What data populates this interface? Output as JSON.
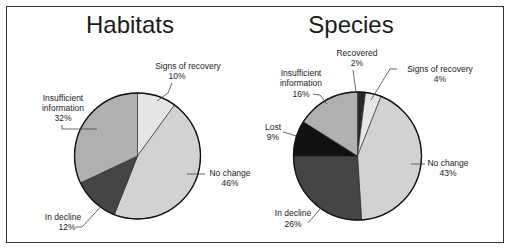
{
  "chart_data": [
    {
      "type": "pie",
      "title": "Habitats",
      "start_angle_deg": 0,
      "direction": "clockwise",
      "slices": [
        {
          "label": "Signs of recovery",
          "value": 10,
          "value_label": "10%",
          "color": "#e6e6e6"
        },
        {
          "label": "No change",
          "value": 46,
          "value_label": "46%",
          "color": "#d2d2d2"
        },
        {
          "label": "In decline",
          "value": 12,
          "value_label": "12%",
          "color": "#454545"
        },
        {
          "label": "Insufficient information",
          "value": 32,
          "value_label": "32%",
          "color": "#b0b0b0"
        }
      ]
    },
    {
      "type": "pie",
      "title": "Species",
      "start_angle_deg": 0,
      "direction": "clockwise",
      "slices": [
        {
          "label": "Recovered",
          "value": 2,
          "value_label": "2%",
          "color": "#2a2a2a"
        },
        {
          "label": "Signs of recovery",
          "value": 4,
          "value_label": "4%",
          "color": "#e6e6e6"
        },
        {
          "label": "No change",
          "value": 43,
          "value_label": "43%",
          "color": "#d2d2d2"
        },
        {
          "label": "In decline",
          "value": 26,
          "value_label": "26%",
          "color": "#454545"
        },
        {
          "label": "Lost",
          "value": 9,
          "value_label": "9%",
          "color": "#111111"
        },
        {
          "label": "Insufficient information",
          "value": 16,
          "value_label": "16%",
          "color": "#b0b0b0"
        }
      ]
    }
  ],
  "habitats": {
    "title": "Habitats",
    "labels": {
      "signs_line1": "Signs of recovery",
      "signs_pct": "10%",
      "insufficient_line1": "Insufficient",
      "insufficient_line2": "information",
      "insufficient_pct": "32%",
      "nochange_line1": "No change",
      "nochange_pct": "46%",
      "decline_line1": "In decline",
      "decline_pct": "12%"
    }
  },
  "species": {
    "title": "Species",
    "labels": {
      "recovered_line1": "Recovered",
      "recovered_pct": "2%",
      "signs_line1": "Signs of recovery",
      "signs_pct": "4%",
      "insufficient_line1": "Insufficient",
      "insufficient_line2": "information",
      "insufficient_pct": "16%",
      "lost_line1": "Lost",
      "lost_pct": "9%",
      "nochange_line1": "No change",
      "nochange_pct": "43%",
      "decline_line1": "In decline",
      "decline_pct": "26%"
    }
  }
}
